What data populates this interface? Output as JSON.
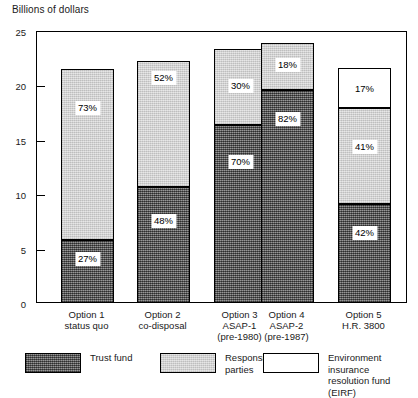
{
  "chart_data": {
    "type": "bar",
    "subtype": "stacked",
    "title": "",
    "ylabel": "Billions of dollars",
    "xlabel": "",
    "ylim": [
      0,
      25
    ],
    "yticks": [
      0,
      5,
      10,
      15,
      20,
      25
    ],
    "ytick_labels": [
      "0",
      "5",
      "10",
      "15",
      "20",
      "25"
    ],
    "grid": false,
    "legend_position": "bottom",
    "categories": [
      "Option 1 status quo",
      "Option 2 co-disposal",
      "Option 3 ASAP-1 (pre-1980)",
      "Option 4 ASAP-2 (pre-1987)",
      "Option 5 H.R. 3800"
    ],
    "category_lines": [
      [
        "Option 1",
        "status quo"
      ],
      [
        "Option 2",
        "co-disposal"
      ],
      [
        "Option 3",
        "ASAP-1",
        "(pre-1980)"
      ],
      [
        "Option 4",
        "ASAP-2",
        "(pre-1987)"
      ],
      [
        "Option 5",
        "H.R. 3800"
      ]
    ],
    "series": [
      {
        "name": "Trust fund",
        "color": "#6b6b6b",
        "values": [
          5.8,
          10.7,
          16.4,
          19.6,
          9.1
        ],
        "percent_labels": [
          "27%",
          "48%",
          "70%",
          "82%",
          "42%"
        ]
      },
      {
        "name": "Responsible parties",
        "color": "#d2d2d2",
        "values": [
          15.7,
          11.6,
          7.0,
          4.3,
          8.9
        ],
        "percent_labels": [
          "73%",
          "52%",
          "30%",
          "18%",
          "41%"
        ]
      },
      {
        "name": "Environment insurance resolution fund (EIRF)",
        "color": "#ffffff",
        "values": [
          0,
          0,
          0,
          0,
          3.6
        ],
        "percent_labels": [
          "",
          "",
          "",
          "",
          "17%"
        ]
      }
    ],
    "totals": [
      21.5,
      22.3,
      23.4,
      23.9,
      21.6
    ]
  },
  "legend": {
    "items": [
      {
        "label": "Trust fund",
        "swatch": "trust"
      },
      {
        "label": "Responsible\nparties",
        "swatch": "responsible"
      },
      {
        "label": "Environment insurance\nresolution fund (EIRF)",
        "swatch": "eirf"
      }
    ]
  }
}
